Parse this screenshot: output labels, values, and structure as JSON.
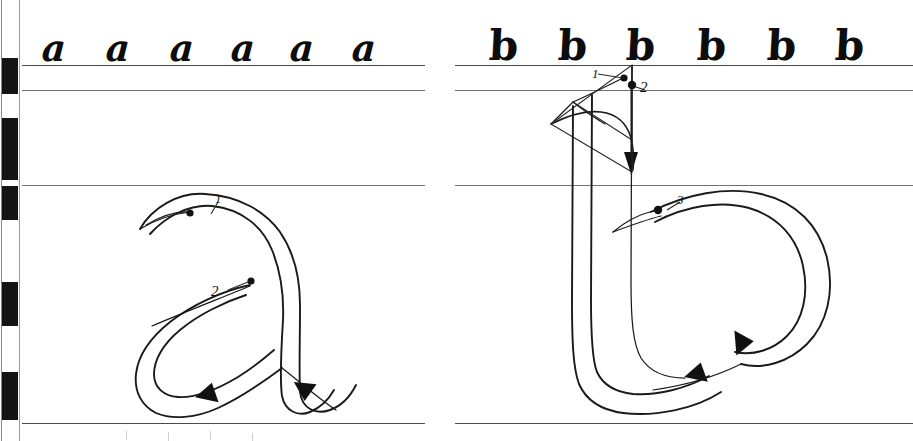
{
  "page": {
    "background_color": "#ffffff",
    "ink_color": "#1a1a1a",
    "guideline_color": "#4a4a4a",
    "width": 913,
    "height": 441
  },
  "edge_bar": {
    "name": "registration-edge-bar",
    "description": "black and white alternating calibration strip along left margin",
    "black_color": "#141414",
    "white_color": "#ffffff",
    "segments": [
      {
        "top": 58,
        "height": 36
      },
      {
        "top": 118,
        "height": 62
      },
      {
        "top": 186,
        "height": 34
      },
      {
        "top": 282,
        "height": 44
      },
      {
        "top": 372,
        "height": 48
      }
    ]
  },
  "guidelines": {
    "label": "horizontal writing guidelines",
    "left_panel": [
      {
        "name": "ascender-line",
        "y": 65
      },
      {
        "name": "cap-line",
        "y": 90
      },
      {
        "name": "waist-line",
        "y": 185
      },
      {
        "name": "base-line",
        "y": 423
      }
    ],
    "right_panel": [
      {
        "name": "ascender-line",
        "y": 65
      },
      {
        "name": "cap-line",
        "y": 90
      },
      {
        "name": "waist-line",
        "y": 185
      },
      {
        "name": "base-line",
        "y": 423
      }
    ]
  },
  "left_panel": {
    "name": "letter-a-panel",
    "sample_letter": "a",
    "sample_row": {
      "letters": [
        "a",
        "a",
        "a",
        "a",
        "a",
        "a"
      ],
      "positions": [
        42,
        106,
        170,
        231,
        290,
        352
      ],
      "count": 6
    },
    "large_demo": {
      "letter": "a",
      "stroke_count": 2,
      "stroke_labels": [
        "1",
        "2"
      ],
      "strokes": [
        {
          "number": "1",
          "name": "stroke-1-arch-and-stem",
          "start_dot": [
            188,
            213
          ],
          "label_pos": [
            216,
            206
          ],
          "direction": "down-right, over the arch and down the stem, finishing with a foot kick to the right"
        },
        {
          "number": "2",
          "name": "stroke-2-lower-bowl",
          "start_dot": [
            252,
            280
          ],
          "label_pos": [
            232,
            290
          ],
          "direction": "down-left into the bowl, around the bottom and out to the right"
        }
      ]
    }
  },
  "right_panel": {
    "name": "letter-b-panel",
    "sample_letter": "b",
    "sample_row": {
      "letters": [
        "b",
        "b",
        "b",
        "b",
        "b",
        "b"
      ],
      "positions": [
        489,
        558,
        626,
        697,
        767,
        835
      ],
      "count": 6
    },
    "large_demo": {
      "letter": "b",
      "stroke_count": 3,
      "stroke_labels": [
        "1",
        "2",
        "3"
      ],
      "strokes": [
        {
          "number": "1",
          "name": "stroke-1-ascender-serif",
          "start_dot": [
            622,
            79
          ],
          "label_pos": [
            597,
            74
          ],
          "direction": "short diagonal serif pulled down-left then curved into the ascender"
        },
        {
          "number": "2",
          "name": "stroke-2-ascender-stem",
          "start_dot": [
            630,
            85
          ],
          "label_pos": [
            641,
            84
          ],
          "direction": "straight down the full ascender, then round the bottom and sweep right"
        },
        {
          "number": "3",
          "name": "stroke-3-bowl",
          "start_dot": [
            705,
            208
          ],
          "label_pos": [
            725,
            200
          ],
          "direction": "arch to the right, down around the bowl and back to the stem"
        }
      ]
    }
  },
  "faint_next_row": {
    "name": "faint-ascender-ticks-next-row",
    "note": "barely visible tops of the following line of letters below the baseline",
    "x_positions": [
      126,
      168,
      210,
      252
    ]
  }
}
